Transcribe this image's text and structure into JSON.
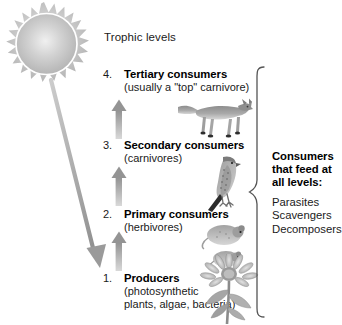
{
  "diagram": {
    "title": "Trophic levels",
    "levels": [
      {
        "number": "4.",
        "title": "Tertiary consumers",
        "subtitle": "(usually a \"top\" carnivore)",
        "organism": "fox-illustration"
      },
      {
        "number": "3.",
        "title": "Secondary consumers",
        "subtitle": "(carnivores)",
        "organism": "falcon-illustration"
      },
      {
        "number": "2.",
        "title": "Primary consumers",
        "subtitle": "(herbivores)",
        "organism": "mouse-illustration"
      },
      {
        "number": "1.",
        "title": "Producers",
        "subtitle_line1": "(photosynthetic",
        "subtitle_line2": "plants, algae, bacteria)",
        "organism": "flower-illustration"
      }
    ],
    "side_note": {
      "heading_line1": "Consumers",
      "heading_line2": "that feed at",
      "heading_line3": "all levels:",
      "items": [
        "Parasites",
        "Scavengers",
        "Decomposers"
      ]
    },
    "icons": {
      "sun": "sun-icon",
      "sun_ray": "sun-ray-arrow-icon",
      "energy_arrow": "up-arrow-icon",
      "bracket": "curly-brace-icon"
    },
    "colors": {
      "arrow_gray": "#9a9a9a",
      "sun_gray": "#b9b9b9",
      "text": "#111111",
      "background": "#ffffff"
    }
  }
}
